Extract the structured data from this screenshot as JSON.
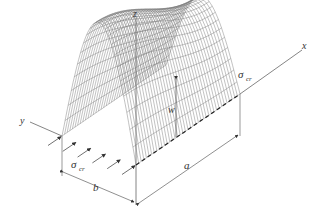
{
  "diagram": {
    "axes": {
      "x_label": "x",
      "y_label": "y",
      "z_label": "z"
    },
    "labels": {
      "deflection": "w",
      "length": "a",
      "width": "b",
      "stress_symbol": "σ",
      "stress_subscript": "cr"
    },
    "colors": {
      "line": "#555555",
      "mesh": "#777777",
      "background": "#ffffff"
    }
  }
}
